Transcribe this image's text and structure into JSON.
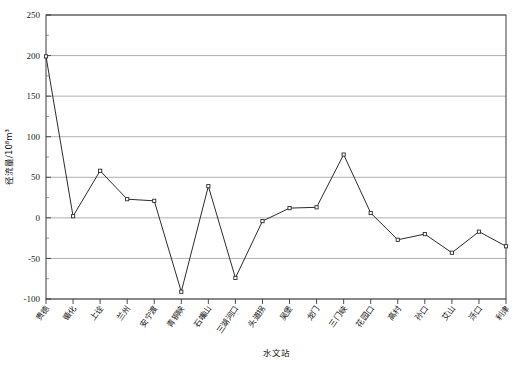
{
  "chart_data": {
    "type": "line",
    "title": "",
    "xlabel": "水文站",
    "ylabel": "径流量/10⁸m³",
    "ylim": [
      -100,
      250
    ],
    "ytick_values": [
      -100,
      -50,
      0,
      50,
      100,
      150,
      200,
      250
    ],
    "ytick_labels": [
      "-100",
      "-50",
      "0",
      "50",
      "100",
      "150",
      "200",
      "250"
    ],
    "grid": "horizontal",
    "legend": "none",
    "marker": "open-square",
    "categories": [
      "贵德",
      "循化",
      "上诠",
      "兰州",
      "安宁渡",
      "青铜峡",
      "石嘴山",
      "三湖河口",
      "头道拐",
      "吴堡",
      "龙门",
      "三门峡",
      "花园口",
      "高村",
      "孙口",
      "艾山",
      "泺口",
      "利津"
    ],
    "values": [
      199,
      2,
      58,
      23,
      21,
      -91,
      39,
      -74,
      -4,
      12,
      13,
      78,
      6,
      -27,
      -20,
      -43,
      -17,
      -35
    ],
    "series": [
      {
        "name": "径流量",
        "values": [
          199,
          2,
          58,
          23,
          21,
          -91,
          39,
          -74,
          -4,
          12,
          13,
          78,
          6,
          -27,
          -20,
          -43,
          -17,
          -35
        ]
      }
    ]
  },
  "axis": {
    "y_title": "径流量/10⁸m³",
    "x_title": "水文站"
  },
  "colors": {
    "line": "#2b2b2b",
    "grid": "#9a9a9a",
    "frame": "#3a3a3a",
    "marker_fill": "#ffffff",
    "background": "#ffffff"
  }
}
